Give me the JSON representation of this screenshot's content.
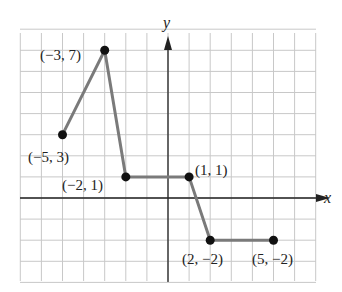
{
  "chart_data": {
    "type": "line",
    "title": "",
    "xlabel": "x",
    "ylabel": "y",
    "xlim": [
      -7,
      7
    ],
    "ylim": [
      -4,
      8
    ],
    "grid": true,
    "legend": null,
    "series": [
      {
        "name": "piecewise",
        "points": [
          [
            -5,
            3
          ],
          [
            -3,
            7
          ],
          [
            -2,
            1
          ],
          [
            1,
            1
          ],
          [
            2,
            -2
          ],
          [
            5,
            -2
          ]
        ]
      }
    ],
    "annotations": [
      {
        "text": "(−5, 3)",
        "x": -5,
        "y": 3
      },
      {
        "text": "(−3, 7)",
        "x": -3,
        "y": 7
      },
      {
        "text": "(−2, 1)",
        "x": -2,
        "y": 1
      },
      {
        "text": "(1, 1)",
        "x": 1,
        "y": 1
      },
      {
        "text": "(2, −2)",
        "x": 2,
        "y": -2
      },
      {
        "text": "(5, −2)",
        "x": 5,
        "y": -2
      }
    ]
  },
  "labels": {
    "x_axis": "x",
    "y_axis": "y",
    "p1": "(−5, 3)",
    "p2": "(−3, 7)",
    "p3": "(−2, 1)",
    "p4": "(1, 1)",
    "p5": "(2, −2)",
    "p6": "(5, −2)"
  },
  "colors": {
    "grid": "#c8c8c8",
    "line": "#7a7a7a",
    "point": "#111111",
    "axis": "#222222"
  }
}
